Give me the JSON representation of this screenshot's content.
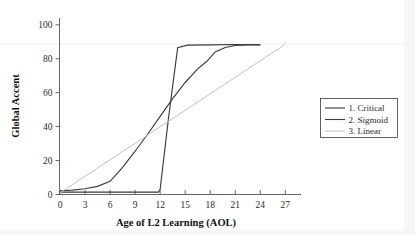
{
  "chart_data": {
    "type": "line",
    "title": "",
    "xlabel": "Age of L2 Learning (AOL)",
    "ylabel": "Global Accent",
    "xlim": [
      -1.5,
      29
    ],
    "ylim": [
      0,
      104
    ],
    "xticks": [
      0,
      3,
      6,
      9,
      12,
      15,
      18,
      21,
      24,
      27
    ],
    "xtick_labels": [
      "0",
      "3",
      "6",
      "9",
      "12",
      "15",
      "18",
      "21",
      "24",
      "27"
    ],
    "yticks": [
      0,
      20,
      40,
      60,
      80,
      100
    ],
    "ytick_labels": [
      "0",
      "20",
      "40",
      "60",
      "80",
      "100"
    ],
    "grid": false,
    "legend_position": "right",
    "series": [
      {
        "name": "1. Critical",
        "color": "#3b3b3b",
        "width": 1.15,
        "x": [
          0,
          6,
          11.8,
          12.0,
          13.0,
          14.1,
          15.3,
          18,
          21,
          24
        ],
        "y": [
          1.4,
          1.4,
          1.4,
          3.0,
          45.0,
          86.5,
          88.0,
          88.2,
          88.4,
          88.2
        ]
      },
      {
        "name": "2. Sigmoid",
        "color": "#3b3b3b",
        "width": 1.15,
        "x": [
          0,
          1.5,
          3,
          4.5,
          6,
          7.5,
          9,
          10.5,
          12,
          13.5,
          15,
          16.5,
          17.6,
          18.6,
          19.8,
          21,
          22.5,
          24
        ],
        "y": [
          2.2,
          2.6,
          3.4,
          4.8,
          7.8,
          16.0,
          25.5,
          35.5,
          46.0,
          56.5,
          66.0,
          74.0,
          78.5,
          84.0,
          86.6,
          87.8,
          88.2,
          88.3
        ]
      },
      {
        "name": "3. Linear",
        "color": "#c3c3c3",
        "width": 1.0,
        "x": [
          0,
          27
        ],
        "y": [
          1.0,
          88.5
        ]
      }
    ]
  },
  "legend": {
    "entries": [
      {
        "label": "1. Critical",
        "color": "#3b3b3b"
      },
      {
        "label": "2. Sigmoid",
        "color": "#3b3b3b"
      },
      {
        "label": "3. Linear",
        "color": "#c3c3c3"
      }
    ]
  }
}
